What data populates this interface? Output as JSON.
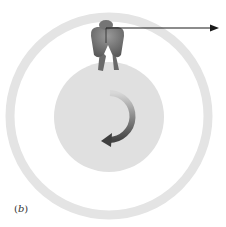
{
  "figure": {
    "panel_label": "(b)",
    "panel_label_parts": {
      "open": "(",
      "letter": "b",
      "close": ")"
    },
    "colors": {
      "background": "#ffffff",
      "outer_ring": "#e4e4e4",
      "inner_disk": "#e0e0e0",
      "person": "#6e6e6e",
      "arrow": "#1a1a1a",
      "rotation_arrow": "#555555"
    },
    "elements": {
      "outer_ring": {
        "cx": 109,
        "cy": 116,
        "r": 99,
        "stroke_width": 9
      },
      "inner_disk": {
        "cx": 109,
        "cy": 117,
        "r": 55
      },
      "person": {
        "x": 106,
        "y": 38
      },
      "velocity_arrow": {
        "x1": 106,
        "y1": 28,
        "x2": 218,
        "y2": 28
      },
      "rotation_arrow": {
        "direction": "counterclockwise"
      }
    }
  }
}
